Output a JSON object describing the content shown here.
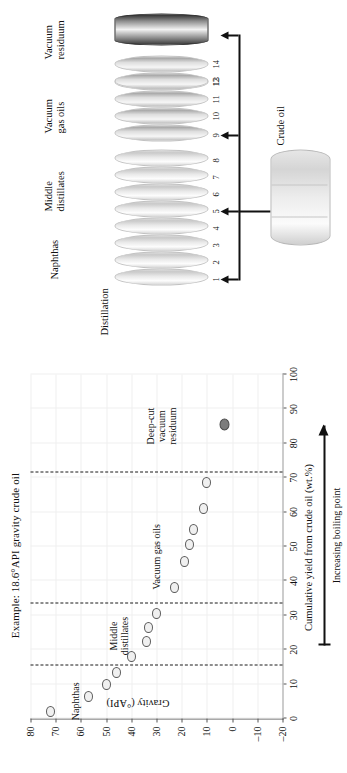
{
  "chart_data": {
    "type": "scatter",
    "title": "Example: 18.6°API gravity crude oil",
    "xlabel": "Cumulative yield from crude oil (wt.%)",
    "ylabel": "Gravity (°API)",
    "xlim": [
      0,
      100
    ],
    "ylim": [
      -20,
      80
    ],
    "xticks": [
      0,
      10,
      20,
      30,
      40,
      50,
      60,
      70,
      80,
      90,
      100
    ],
    "yticks": [
      80,
      70,
      60,
      50,
      40,
      30,
      20,
      10,
      0,
      -10,
      -20
    ],
    "grid": true,
    "legend": "none",
    "series": [
      {
        "name": "Naphthas",
        "marker": "open-circle",
        "points": [
          {
            "x": 2,
            "y": 72
          },
          {
            "x": 6.5,
            "y": 57
          },
          {
            "x": 10,
            "y": 50
          },
          {
            "x": 13.5,
            "y": 46
          }
        ]
      },
      {
        "name": "Middle distillates",
        "marker": "open-circle",
        "points": [
          {
            "x": 18,
            "y": 40
          },
          {
            "x": 22.5,
            "y": 34
          },
          {
            "x": 26.5,
            "y": 33
          },
          {
            "x": 30.5,
            "y": 30
          }
        ]
      },
      {
        "name": "Vacuum gas oils",
        "marker": "open-circle",
        "points": [
          {
            "x": 38,
            "y": 23
          },
          {
            "x": 45.5,
            "y": 19
          },
          {
            "x": 50.5,
            "y": 17
          },
          {
            "x": 55,
            "y": 15.5
          },
          {
            "x": 61,
            "y": 11.5
          },
          {
            "x": 68.5,
            "y": 10
          }
        ]
      },
      {
        "name": "Deep-cut vacuum residuum",
        "marker": "filled-circle",
        "points": [
          {
            "x": 85.5,
            "y": 3
          }
        ]
      }
    ],
    "cut_lines": [
      {
        "x": 15.5,
        "style": "dashed"
      },
      {
        "x": 33.5,
        "style": "dashed"
      },
      {
        "x": 71.5,
        "style": "dashed"
      }
    ],
    "annotations": [
      {
        "text": "Naphthas",
        "x": 5,
        "y": 62
      },
      {
        "text_lines": [
          "Middle",
          "distillates"
        ],
        "x": 24,
        "y": 45
      },
      {
        "text": "Vacuum gas oils",
        "x": 47,
        "y": 30
      },
      {
        "text_lines": [
          "Deep-cut",
          "vacuum",
          "residuum"
        ],
        "x": 85,
        "y": 28
      }
    ],
    "axis_arrow": {
      "label": "Increasing boiling point",
      "direction": "right"
    }
  },
  "chart": {
    "title": "Example: 18.6°API gravity crude oil",
    "xaxis_title": "Cumulative yield from crude oil (wt.%)",
    "yaxis_title": "Gravity (°API)",
    "arrow_label": "Increasing boiling point",
    "annotations": {
      "naphthas": "Naphthas",
      "middle_line1": "Middle",
      "middle_line2": "distillates",
      "vacuum_gas_oils": "Vacuum gas oils",
      "deepcut_line1": "Deep-cut",
      "deepcut_line2": "vacuum",
      "deepcut_line3": "residuum"
    },
    "xticks": [
      "0",
      "10",
      "20",
      "30",
      "40",
      "50",
      "60",
      "70",
      "80",
      "90",
      "100"
    ],
    "yticks": [
      "80",
      "70",
      "60",
      "50",
      "40",
      "30",
      "20",
      "10",
      "0",
      "–10",
      "–20"
    ]
  },
  "schematic": {
    "title": "Distillation",
    "crude_label": "Crude oil",
    "groups": [
      {
        "label_line1": "Naphthas",
        "label_line2": "",
        "cuts": [
          "1",
          "2",
          "3",
          "4"
        ]
      },
      {
        "label_line1": "Middle",
        "label_line2": "distillates",
        "cuts": [
          "5",
          "6",
          "7",
          "8"
        ]
      },
      {
        "label_line1": "Vacuum",
        "label_line2": "gas oils",
        "cuts": [
          "9",
          "10",
          "11",
          "12",
          "13",
          "14"
        ]
      },
      {
        "label_line1": "Vacuum",
        "label_line2": "residuum",
        "cuts": []
      }
    ]
  },
  "colors": {
    "axis": "#555555",
    "grid": "#efefef",
    "cut_line": "#1a1a1a",
    "marker_fill": "#f0f0f0",
    "marker_edge": "#5a5a5a",
    "marker_filled": "#7c7c7c",
    "ink": "#111111"
  }
}
